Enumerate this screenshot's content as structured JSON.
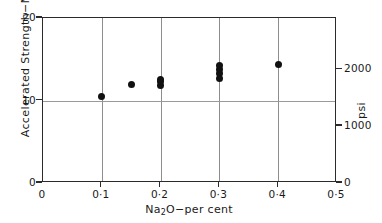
{
  "chart_data": {
    "type": "scatter",
    "title": "",
    "xlabel": "Na2O-per cent",
    "ylabel": "Accelerated Strength-MPa",
    "y2label": "psi",
    "xlim": [
      0,
      0.5
    ],
    "ylim": [
      0,
      20
    ],
    "y2lim": [
      0,
      2900
    ],
    "grid": true,
    "legend": "none",
    "xticks": [
      0,
      0.1,
      0.2,
      0.3,
      0.4,
      0.5
    ],
    "xticklabels": [
      "0",
      "0·1",
      "0·2",
      "0·3",
      "0·4",
      "0·5"
    ],
    "yticks": [
      0,
      10,
      20
    ],
    "yticklabels": [
      "0",
      "10",
      "20"
    ],
    "y2ticks": [
      0,
      1000,
      2000
    ],
    "y2ticklabels": [
      "0",
      "1000",
      "2000"
    ],
    "gridlines_v": [
      0.1,
      0.2,
      0.3,
      0.4
    ],
    "gridlines_h": [
      10
    ],
    "series": [
      {
        "name": "Accelerated strength",
        "marker": "filled-circle",
        "color": "#111111",
        "points": [
          {
            "x": 0.1,
            "y": 10.5
          },
          {
            "x": 0.15,
            "y": 11.9
          },
          {
            "x": 0.2,
            "y": 11.8
          },
          {
            "x": 0.2,
            "y": 12.3
          },
          {
            "x": 0.2,
            "y": 12.6
          },
          {
            "x": 0.3,
            "y": 12.7
          },
          {
            "x": 0.3,
            "y": 13.3
          },
          {
            "x": 0.3,
            "y": 13.8
          },
          {
            "x": 0.3,
            "y": 14.2
          },
          {
            "x": 0.4,
            "y": 14.4
          }
        ]
      }
    ]
  },
  "axes": {
    "x_title_prefix": "Na",
    "x_title_sub": "2",
    "x_title_suffix": "O−per cent",
    "y_title": "Accelerated Strength−MPa",
    "y2_title": "psi"
  }
}
